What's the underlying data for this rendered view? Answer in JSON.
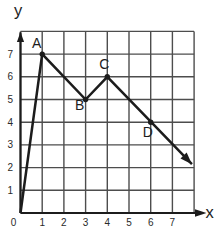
{
  "chart_data": {
    "type": "line",
    "title": "",
    "xlabel": "x",
    "ylabel": "y",
    "xlim": [
      0,
      8
    ],
    "ylim": [
      0,
      8
    ],
    "grid": true,
    "grid_step": 1,
    "x_tick_labels": [
      "0",
      "1",
      "2",
      "3",
      "4",
      "5",
      "6",
      "7"
    ],
    "y_tick_labels": [
      "1",
      "2",
      "3",
      "4",
      "5",
      "6",
      "7"
    ],
    "series": [
      {
        "name": "path-through-ABCD",
        "points": [
          [
            0,
            0
          ],
          [
            1,
            7
          ],
          [
            3,
            5
          ],
          [
            4,
            6
          ],
          [
            7.9,
            2.15
          ]
        ],
        "arrow_at_end": true
      }
    ],
    "marked_points": [
      {
        "label": "A",
        "x": 1,
        "y": 7
      },
      {
        "label": "B",
        "x": 3,
        "y": 5
      },
      {
        "label": "C",
        "x": 4,
        "y": 6
      },
      {
        "label": "D",
        "x": 6,
        "y": 4
      }
    ],
    "axis_arrows": {
      "x": "right",
      "y": "up"
    },
    "colors": {
      "background": "#ffffff",
      "grid": "#4d4d4d",
      "line": "#1c1c1c",
      "text": "#1c1c1c"
    }
  }
}
